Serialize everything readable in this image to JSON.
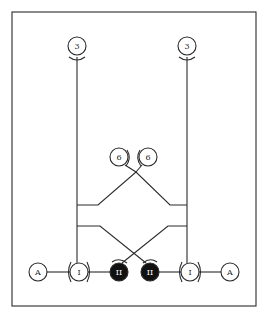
{
  "diagram": {
    "colors": {
      "line": "#2a2a2a",
      "fill_dark": "#111111",
      "background": "#ffffff"
    },
    "nodes": [
      {
        "id": "top-left-3",
        "label": "3",
        "cx": 77,
        "cy": 46,
        "r": 9,
        "filled": false
      },
      {
        "id": "top-right-3",
        "label": "3",
        "cx": 187,
        "cy": 46,
        "r": 9,
        "filled": false
      },
      {
        "id": "mid-left-6",
        "label": "6",
        "cx": 119,
        "cy": 157,
        "r": 9,
        "filled": false
      },
      {
        "id": "mid-right-6",
        "label": "6",
        "cx": 148,
        "cy": 157,
        "r": 9,
        "filled": false
      },
      {
        "id": "bottom-left-A",
        "label": "A",
        "cx": 38,
        "cy": 272,
        "r": 9,
        "filled": false
      },
      {
        "id": "bottom-left-I",
        "label": "I",
        "cx": 79,
        "cy": 272,
        "r": 9,
        "filled": false
      },
      {
        "id": "bottom-left-II",
        "label": "II",
        "cx": 119,
        "cy": 272,
        "r": 9,
        "filled": true
      },
      {
        "id": "bottom-right-II",
        "label": "II",
        "cx": 150,
        "cy": 272,
        "r": 9,
        "filled": true
      },
      {
        "id": "bottom-right-I",
        "label": "I",
        "cx": 190,
        "cy": 272,
        "r": 9,
        "filled": false
      },
      {
        "id": "bottom-right-A",
        "label": "A",
        "cx": 230,
        "cy": 272,
        "r": 9,
        "filled": false
      }
    ]
  }
}
